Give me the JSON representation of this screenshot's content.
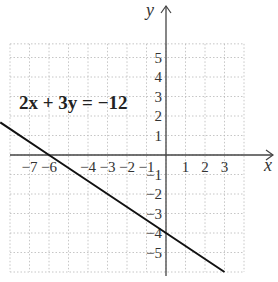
{
  "chart_data": {
    "type": "line",
    "title": "",
    "annotation": "2x + 3y = −12",
    "xlabel": "x",
    "ylabel": "y",
    "xlim": [
      -8,
      4
    ],
    "ylim": [
      -6,
      6
    ],
    "grid": true,
    "x_ticks": [
      -7,
      -6,
      -4,
      -3,
      -2,
      -1,
      1,
      2,
      3
    ],
    "x_tick_labels": [
      "−7",
      "−6",
      "−4",
      "−3",
      "−2",
      "−1",
      "1",
      "2",
      "3"
    ],
    "y_ticks": [
      5,
      4,
      3,
      2,
      1,
      -1,
      -2,
      -3,
      -4,
      -5
    ],
    "y_tick_labels": [
      "5",
      "4",
      "3",
      "2",
      "1",
      "−1",
      "−2",
      "−3",
      "−4",
      "−5"
    ],
    "series": [
      {
        "name": "2x + 3y = -12",
        "equation": "y = -2/3 x - 4",
        "x": [
          -8.5,
          -6,
          0,
          3
        ],
        "y": [
          1.67,
          0,
          -4,
          -6
        ]
      }
    ],
    "intercepts": {
      "x_intercept": [
        -6,
        0
      ],
      "y_intercept": [
        0,
        -4
      ]
    }
  }
}
